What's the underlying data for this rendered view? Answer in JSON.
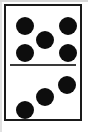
{
  "image": {
    "subject": "domino-tile",
    "description": "A white domino tile with a black border, split by a horizontal line into two halves.",
    "top_half_value": 5,
    "bottom_half_value": 3,
    "total_pips": 8,
    "notation": "5-3"
  },
  "colors": {
    "tile_face": "#ffffff",
    "tile_border": "#1a1a1a",
    "pip": "#0d0d0d",
    "divider": "#3a3a3a",
    "page_margin": "#b9b9b9",
    "background": "#ffffff"
  },
  "tile": {
    "x": 4,
    "y": 4,
    "width": 78,
    "height": 117,
    "border_width": 2,
    "divider_y": 60
  },
  "pips": {
    "radius": 9,
    "top": [
      {
        "name": "pip-top-left",
        "cx": 19,
        "cy": 20
      },
      {
        "name": "pip-top-right",
        "cx": 62,
        "cy": 20
      },
      {
        "name": "pip-center",
        "cx": 39,
        "cy": 34
      },
      {
        "name": "pip-bottom-left",
        "cx": 19,
        "cy": 47
      },
      {
        "name": "pip-bottom-right",
        "cx": 62,
        "cy": 47
      }
    ],
    "bottom": [
      {
        "name": "pip-upper-right",
        "cx": 61,
        "cy": 19
      },
      {
        "name": "pip-middle",
        "cx": 39,
        "cy": 31
      },
      {
        "name": "pip-lower-left",
        "cx": 19,
        "cy": 44
      }
    ]
  }
}
